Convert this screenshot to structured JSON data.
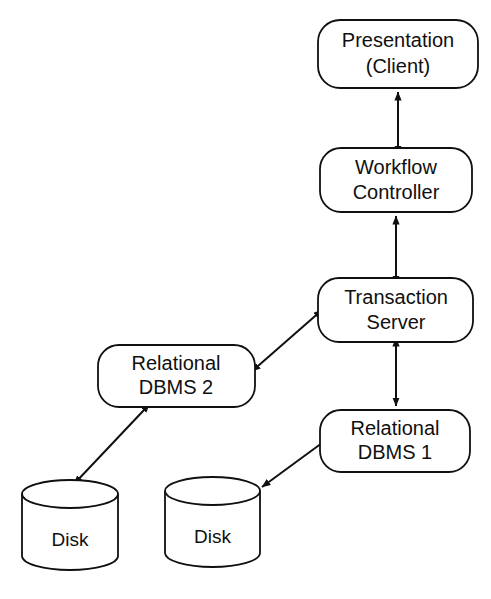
{
  "diagram": {
    "background_color": "#ffffff",
    "stroke_color": "#101010",
    "fill_color": "#ffffff",
    "nodes": [
      {
        "id": "presentation",
        "shape": "rounded-rect",
        "lines": [
          "Presentation",
          "(Client)"
        ],
        "line1": "Presentation",
        "line2": "(Client)",
        "x": 318,
        "y": 20,
        "width": 160,
        "height": 68
      },
      {
        "id": "workflow-controller",
        "shape": "rounded-rect",
        "lines": [
          "Workflow",
          "Controller"
        ],
        "line1": "Workflow",
        "line2": "Controller",
        "x": 320,
        "y": 148,
        "width": 152,
        "height": 64
      },
      {
        "id": "transaction-server",
        "shape": "rounded-rect",
        "lines": [
          "Transaction",
          "Server"
        ],
        "line1": "Transaction",
        "line2": "Server",
        "x": 318,
        "y": 278,
        "width": 155,
        "height": 64
      },
      {
        "id": "relational-dbms-2",
        "shape": "rounded-rect",
        "lines": [
          "Relational",
          "DBMS 2"
        ],
        "line1": "Relational",
        "line2": "DBMS 2",
        "x": 98,
        "y": 345,
        "width": 157,
        "height": 62
      },
      {
        "id": "relational-dbms-1",
        "shape": "rounded-rect",
        "lines": [
          "Relational",
          "DBMS 1"
        ],
        "line1": "Relational",
        "line2": "DBMS 1",
        "x": 320,
        "y": 410,
        "width": 150,
        "height": 62
      },
      {
        "id": "disk-left",
        "shape": "cylinder",
        "lines": [
          "Disk"
        ],
        "line1": "Disk",
        "x": 22,
        "y": 480,
        "width": 96,
        "height": 90
      },
      {
        "id": "disk-right",
        "shape": "cylinder",
        "lines": [
          "Disk"
        ],
        "line1": "Disk",
        "x": 165,
        "y": 477,
        "width": 95,
        "height": 90
      }
    ],
    "connectors": [
      {
        "id": "presentation-workflow",
        "from": "workflow-controller",
        "to": "presentation",
        "arrowheads": "both",
        "orientation": "vertical",
        "x1": 398,
        "y1": 148,
        "x2": 398,
        "y2": 88
      },
      {
        "id": "workflow-transaction",
        "from": "transaction-server",
        "to": "workflow-controller",
        "arrowheads": "both",
        "orientation": "vertical",
        "x1": 396,
        "y1": 278,
        "x2": 396,
        "y2": 212
      },
      {
        "id": "transaction-dbms2",
        "from": "transaction-server",
        "to": "relational-dbms-2",
        "arrowheads": "both",
        "orientation": "diagonal",
        "x1": 318,
        "y1": 313,
        "x2": 255,
        "y2": 368
      },
      {
        "id": "transaction-dbms1",
        "from": "transaction-server",
        "to": "relational-dbms-1",
        "arrowheads": "both",
        "orientation": "vertical",
        "x1": 396,
        "y1": 342,
        "x2": 396,
        "y2": 410
      },
      {
        "id": "dbms2-disk-left",
        "from": "relational-dbms-2",
        "to": "disk-left",
        "arrowheads": "both",
        "orientation": "diagonal",
        "x1": 145,
        "y1": 407,
        "x2": 72,
        "y2": 485
      },
      {
        "id": "dbms1-disk-right",
        "from": "relational-dbms-1",
        "to": "disk-right",
        "arrowheads": "both",
        "orientation": "diagonal",
        "x1": 320,
        "y1": 443,
        "x2": 259,
        "y2": 488
      }
    ]
  }
}
